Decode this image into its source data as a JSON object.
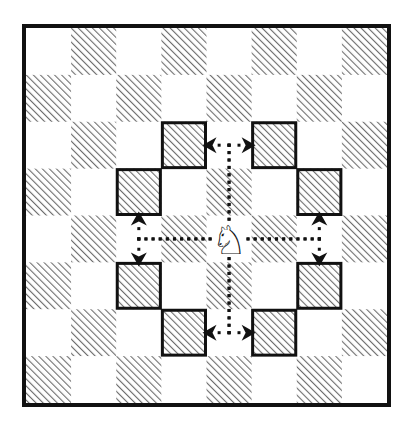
{
  "diagram": {
    "board": {
      "rows": 8,
      "cols": 8,
      "outer": {
        "x": 22,
        "y": 24,
        "width": 369,
        "height": 383,
        "border": 4
      },
      "inner": {
        "x": 26,
        "y": 28,
        "width": 361,
        "height": 375
      },
      "light_color": "#ffffff",
      "dark_pattern": "diagonal-hatch",
      "hatch_color": "#6e6e6e",
      "border_color": "#111111",
      "dark_parity": "odd"
    },
    "piece": {
      "name": "white-knight",
      "glyph": "♘",
      "row": 4,
      "col": 4,
      "color": "#111111"
    },
    "targets": [
      {
        "row": 2,
        "col": 3
      },
      {
        "row": 2,
        "col": 5
      },
      {
        "row": 3,
        "col": 2
      },
      {
        "row": 3,
        "col": 6
      },
      {
        "row": 5,
        "col": 2
      },
      {
        "row": 5,
        "col": 6
      },
      {
        "row": 6,
        "col": 3
      },
      {
        "row": 6,
        "col": 5
      }
    ],
    "paths": [
      {
        "first": "up",
        "steps": 2,
        "turn": "left",
        "target": {
          "row": 2,
          "col": 3
        }
      },
      {
        "first": "up",
        "steps": 2,
        "turn": "right",
        "target": {
          "row": 2,
          "col": 5
        }
      },
      {
        "first": "left",
        "steps": 2,
        "turn": "up",
        "target": {
          "row": 3,
          "col": 2
        }
      },
      {
        "first": "left",
        "steps": 2,
        "turn": "down",
        "target": {
          "row": 5,
          "col": 2
        }
      },
      {
        "first": "right",
        "steps": 2,
        "turn": "up",
        "target": {
          "row": 3,
          "col": 6
        }
      },
      {
        "first": "right",
        "steps": 2,
        "turn": "down",
        "target": {
          "row": 5,
          "col": 6
        }
      },
      {
        "first": "down",
        "steps": 2,
        "turn": "left",
        "target": {
          "row": 6,
          "col": 3
        }
      },
      {
        "first": "down",
        "steps": 2,
        "turn": "right",
        "target": {
          "row": 6,
          "col": 5
        }
      }
    ],
    "style": {
      "target_border_color": "#111111",
      "target_border_width": 3,
      "path_color": "#111111",
      "dot_size": 3,
      "dot_gap": 7,
      "arrow_color": "#111111"
    }
  }
}
